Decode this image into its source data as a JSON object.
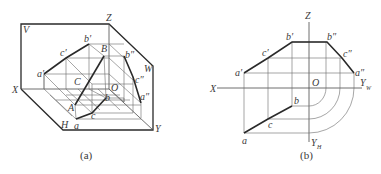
{
  "figure_a": {
    "caption": "(a)",
    "planes": {
      "V": "V",
      "H": "H",
      "W": "W"
    },
    "axes": {
      "X": "X",
      "Y": "Y",
      "Z": "Z",
      "O": "O"
    },
    "points": {
      "A": "A",
      "B": "B",
      "C": "C",
      "a": "a",
      "b": "b",
      "c": "c",
      "a_prime": "a′",
      "b_prime": "b′",
      "c_prime": "c′",
      "a_dprime": "a″",
      "b_dprime": "b″",
      "c_dprime": "c″"
    }
  },
  "figure_b": {
    "caption": "(b)",
    "axes": {
      "X": "X",
      "Z": "Z",
      "O": "O",
      "YW": "Y",
      "YW_sub": "W",
      "YH": "Y",
      "YH_sub": "H"
    },
    "points": {
      "a": "a",
      "b": "b",
      "c": "c",
      "a_prime": "a′",
      "b_prime": "b′",
      "c_prime": "c′",
      "a_dprime": "a″",
      "b_dprime": "b″",
      "c_dprime": "c″"
    }
  }
}
